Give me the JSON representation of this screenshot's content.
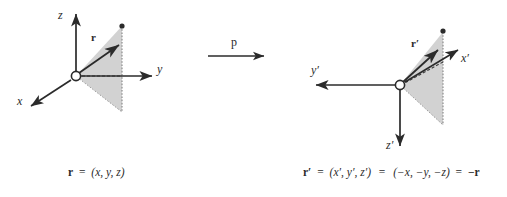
{
  "figure": {
    "type": "vector-diagram",
    "background_color": "#ffffff",
    "ink_color": "#2b2b2b",
    "shade_color": "#d0d0d0",
    "shade_edge_color": "#9a9a9a"
  },
  "transform": {
    "operator_label": "p",
    "arrow_name": "parity-operator-arrow",
    "direction": "left-to-right"
  },
  "left_panel": {
    "name": "original-frame",
    "origin_label": "O",
    "axes": [
      {
        "key": "z",
        "label": "z",
        "direction": "up",
        "arrow": true
      },
      {
        "key": "y",
        "label": "y",
        "direction": "right",
        "arrow": true
      },
      {
        "key": "x",
        "label": "x",
        "direction": "down-left",
        "arrow": true
      }
    ],
    "vector": {
      "label": "r",
      "name": "position-vector-r",
      "bold": true,
      "arrow": true
    },
    "shaded_region": {
      "name": "projection-triangle",
      "fill": "#d0d0d0",
      "dashed_edges": true
    },
    "caption": {
      "vector": "r",
      "equals": "=",
      "components": "(x, y, z)"
    }
  },
  "right_panel": {
    "name": "inverted-frame",
    "origin_label": "O",
    "axes": [
      {
        "key": "z-prime",
        "label": "z",
        "prime": "′",
        "direction": "down",
        "arrow": true
      },
      {
        "key": "y-prime",
        "label": "y",
        "prime": "′",
        "direction": "left",
        "arrow": true
      },
      {
        "key": "x-prime",
        "label": "x",
        "prime": "′",
        "direction": "up-right",
        "arrow": true
      }
    ],
    "vector": {
      "label": "r",
      "prime": "′",
      "name": "position-vector-r-prime",
      "bold": true,
      "arrow": true
    },
    "shaded_region": {
      "name": "projection-triangle",
      "fill": "#d0d0d0",
      "dashed_edges": true
    },
    "caption": {
      "vector": "r′",
      "equals_1": "=",
      "components_primed": "(x′, y′, z′)",
      "equals_2": "=",
      "components_negated": "(−x, −y, −z)",
      "equals_3": "=",
      "result": "−r"
    }
  },
  "labels": {
    "z": "z",
    "y": "y",
    "x": "x",
    "r": "r",
    "z_prime": "z′",
    "y_prime": "y′",
    "x_prime": "x′",
    "r_prime": "r′",
    "p": "p"
  },
  "caption_text": {
    "left_full": "r = (x, y, z)",
    "right_full": "r′ = (x′, y′, z′) = (−x, −y, −z) = −r"
  }
}
